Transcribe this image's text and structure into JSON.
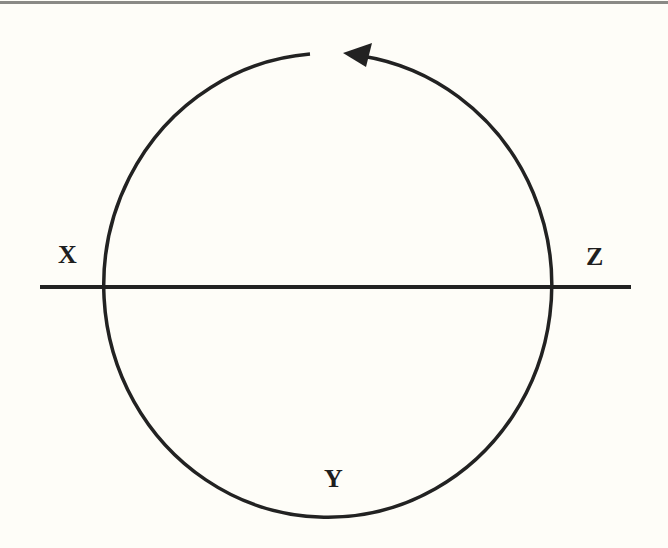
{
  "diagram": {
    "labels": {
      "x": "X",
      "y": "Y",
      "z": "Z"
    },
    "colors": {
      "background": "#fefdf8",
      "stroke": "#222222",
      "top_rule": "#8a8a86"
    },
    "elements": {
      "circle": "circular path with gap at top, arrowhead pointing counter-clockwise (leftward at top)",
      "horizontal_line": "horizontal line crossing circle at points X (left) and Z (right)",
      "arrow_direction": "counter-clockwise"
    }
  }
}
